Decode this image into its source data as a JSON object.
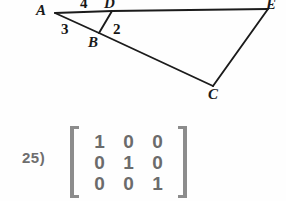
{
  "figure": {
    "vertices": [
      {
        "id": "A",
        "label": "A",
        "x": 55,
        "y": 13
      },
      {
        "id": "D",
        "label": "D",
        "x": 112,
        "y": 11
      },
      {
        "id": "E",
        "label": "E",
        "x": 266,
        "y": 10
      },
      {
        "id": "B",
        "label": "B",
        "x": 99,
        "y": 33
      },
      {
        "id": "C",
        "label": "C",
        "x": 213,
        "y": 86
      }
    ],
    "segment_labels": [
      {
        "id": "seg-AD",
        "label": "4"
      },
      {
        "id": "seg-AB",
        "label": "3"
      },
      {
        "id": "seg-BD",
        "label": "2"
      }
    ],
    "line_color": "#1b1b1b"
  },
  "problem": {
    "number": "25)",
    "matrix": {
      "rows": [
        [
          "1",
          "0",
          "0"
        ],
        [
          "0",
          "1",
          "0"
        ],
        [
          "0",
          "0",
          "1"
        ]
      ],
      "bracket_color": "#8c8c8c",
      "text_color": "#6b6b6b"
    }
  }
}
